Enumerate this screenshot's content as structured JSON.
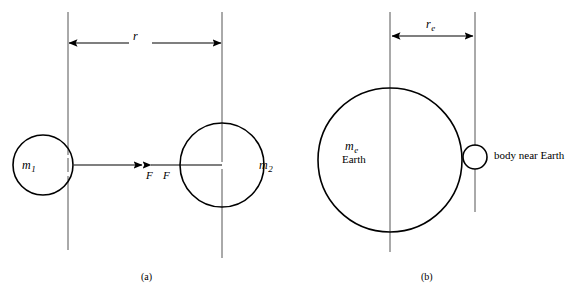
{
  "figure": {
    "type": "diagram",
    "stroke_color": "#000000",
    "center_line_color": "#555555",
    "background_color": "#ffffff"
  },
  "panel_a": {
    "caption": "(a)",
    "mass_left": {
      "symbol": "m",
      "subscript": "1"
    },
    "mass_right": {
      "symbol": "m",
      "subscript": "2"
    },
    "distance": {
      "symbol": "r",
      "subscript": ""
    },
    "force_left": "F",
    "force_right": "F",
    "geometry": {
      "circle_left": {
        "cx": 43,
        "cy": 165,
        "r": 30
      },
      "circle_right": {
        "cx": 222,
        "cy": 165,
        "r": 42
      },
      "axis_left_x": 68,
      "axis_right_x": 222,
      "axis_top_y": 12,
      "axis_bottom_left_y": 250,
      "axis_bottom_right_y": 258,
      "dimension_y": 43,
      "force_y": 165,
      "force_arrow_left_start": 74,
      "force_arrow_left_end": 142,
      "force_arrow_right_start": 222,
      "force_arrow_right_end": 150
    }
  },
  "panel_b": {
    "caption": "(b)",
    "mass_earth": {
      "symbol": "m",
      "subscript": "e"
    },
    "earth_name": "Earth",
    "distance": {
      "symbol": "r",
      "subscript": "e"
    },
    "body_label": "body near Earth",
    "geometry": {
      "circle_earth": {
        "cx": 390,
        "cy": 160,
        "r": 72
      },
      "circle_body": {
        "cx": 475,
        "cy": 157,
        "r": 12
      },
      "axis_earth_x": 390,
      "axis_body_x": 475,
      "axis_top_y": 12,
      "axis_bottom_y": 252,
      "dimension_y": 36,
      "dimension_x_start": 391,
      "dimension_x_end": 474
    }
  }
}
